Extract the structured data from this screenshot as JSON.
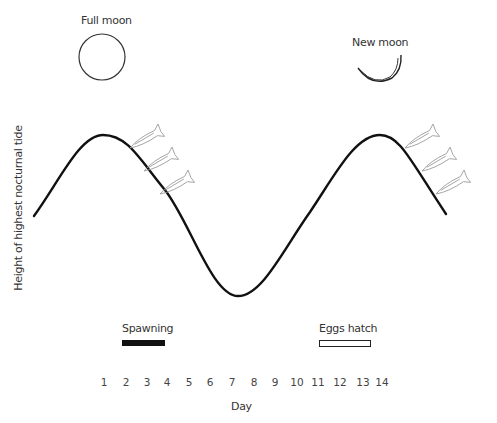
{
  "figure": {
    "moons": {
      "full": {
        "label": "Full moon"
      },
      "new": {
        "label": "New moon"
      }
    },
    "y_axis_label": "Height of highest nocturnal tide",
    "x_axis_label": "Day",
    "days": [
      "1",
      "2",
      "3",
      "4",
      "5",
      "6",
      "7",
      "8",
      "9",
      "10",
      "11",
      "12",
      "13",
      "14"
    ],
    "legend": {
      "spawning": {
        "label": "Spawning",
        "fill": "#111111"
      },
      "eggs_hatch": {
        "label": "Eggs hatch",
        "fill": "#ffffff",
        "stroke": "#222222"
      }
    },
    "curve_color": "#111111",
    "fish_color": "#9a9a9a"
  }
}
